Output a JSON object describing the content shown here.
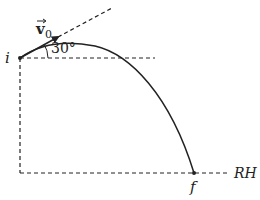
{
  "diagram": {
    "labels": {
      "initial_point": "i",
      "final_point": "f",
      "reference_height": "RH",
      "velocity_symbol": "v",
      "velocity_subscript": "0",
      "angle": "30°"
    },
    "colors": {
      "stroke": "#222222",
      "background": "#ffffff"
    },
    "geometry": {
      "launch_angle_deg": 30,
      "initial_point": [
        20,
        58
      ],
      "final_point": [
        194,
        173
      ],
      "apex": [
        85,
        44
      ],
      "reference_line_y": 173
    }
  }
}
